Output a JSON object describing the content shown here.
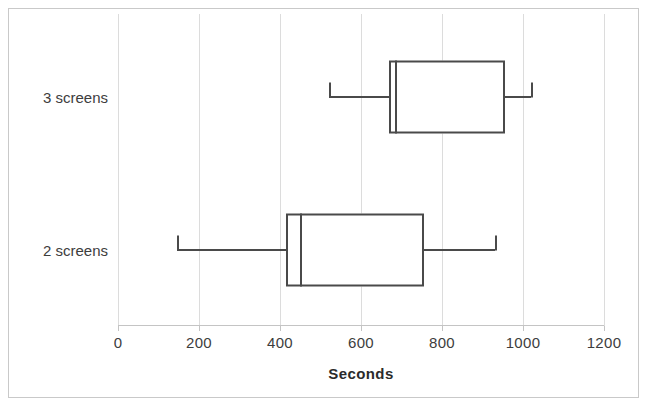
{
  "chart_data": {
    "type": "box",
    "title": "",
    "xlabel": "Seconds",
    "ylabel": "",
    "orientation": "horizontal",
    "grid": true,
    "legend": "none",
    "xlim": [
      0,
      1200
    ],
    "xticks": [
      0,
      200,
      400,
      600,
      800,
      1000,
      1200
    ],
    "xtick_labels": [
      "0",
      "200",
      "400",
      "600",
      "800",
      "1000",
      "1200"
    ],
    "categories": [
      "2 screens",
      "3 screens"
    ],
    "boxes": [
      {
        "category": "3 screens",
        "min": 520,
        "q1": 670,
        "median": 685,
        "q3": 955,
        "max": 1020
      },
      {
        "category": "2 screens",
        "min": 145,
        "q1": 415,
        "median": 450,
        "q3": 755,
        "max": 930
      }
    ],
    "colors": {
      "stroke": "#4a4a4a",
      "grid": "#dcdcdc",
      "axis": "#c4c4c4",
      "text": "#3d3d3d",
      "background": "#ffffff"
    }
  }
}
